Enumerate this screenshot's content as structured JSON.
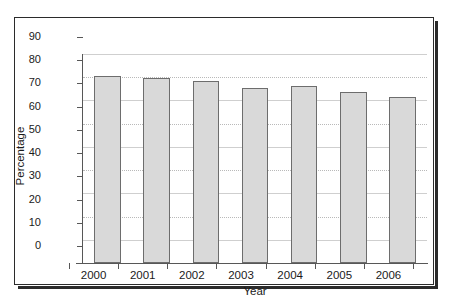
{
  "chart_data": {
    "type": "bar",
    "title": "",
    "xlabel": "Year",
    "ylabel": "Percentage",
    "categories": [
      "2000",
      "2001",
      "2002",
      "2003",
      "2004",
      "2005",
      "2006"
    ],
    "values": [
      80.5,
      79.8,
      78.3,
      75.5,
      76.2,
      73.7,
      71.5
    ],
    "ylim": [
      0,
      90
    ],
    "ytick_labels": [
      "0",
      "10",
      "20",
      "30",
      "40",
      "50",
      "60",
      "70",
      "80",
      "90"
    ],
    "ytick_values": [
      0,
      10,
      20,
      30,
      40,
      50,
      60,
      70,
      80,
      90
    ],
    "grid": true,
    "legend": "none",
    "bar_fill_color": "#d9d9d9",
    "bar_edge_color": "#6d6d6d",
    "gridline_color": "#b9b9b9",
    "axis_color": "#575757",
    "frame_color": "#2b2b2b"
  }
}
